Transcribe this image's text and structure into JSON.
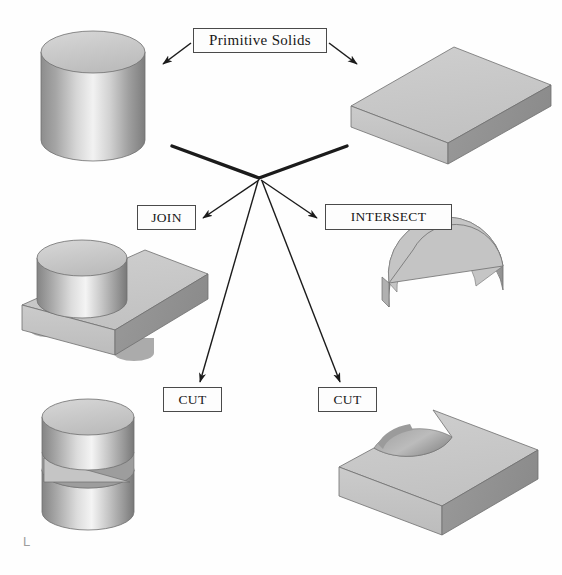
{
  "diagram": {
    "title_label": "Primitive Solids",
    "corner_mark": "L",
    "operations": {
      "join": "JOIN",
      "intersect": "INTERSECT",
      "cut_left": "CUT",
      "cut_right": "CUT"
    },
    "shapes": [
      {
        "name": "cylinder",
        "role": "primitive-solid",
        "position": "top-left"
      },
      {
        "name": "rectangular-block",
        "role": "primitive-solid",
        "position": "top-right"
      },
      {
        "name": "cylinder-on-block-union",
        "role": "join-result",
        "position": "middle-left"
      },
      {
        "name": "half-cylinder-wedge",
        "role": "intersect-result",
        "position": "middle-right"
      },
      {
        "name": "cylinder-with-slot",
        "role": "cut-result",
        "position": "bottom-left"
      },
      {
        "name": "block-with-circular-notch",
        "role": "cut-result",
        "position": "bottom-right"
      }
    ],
    "colors": {
      "outline": "#4a4a4a",
      "arrow": "#1b1b1b",
      "solid_light": "#e2e2e2",
      "solid_mid": "#b8b8b8",
      "solid_dark": "#8e8e8e",
      "background": "#fefefe"
    }
  }
}
